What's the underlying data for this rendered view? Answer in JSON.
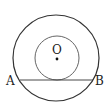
{
  "diagram": {
    "type": "geometry",
    "labels": {
      "center": "O",
      "point_a": "A",
      "point_b": "B"
    },
    "colors": {
      "stroke": "#333333",
      "inner_stroke": "#555555",
      "background": "#ffffff"
    }
  }
}
